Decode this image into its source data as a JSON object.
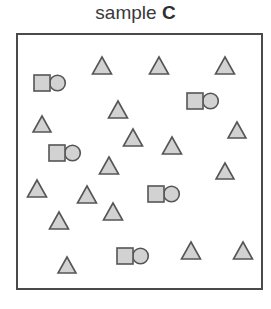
{
  "title": {
    "label": "sample",
    "id": "C"
  },
  "colors": {
    "fill": "#d2d2d2",
    "stroke": "#555555",
    "border": "#4a4a4a",
    "text": "#3a3a3a"
  },
  "shapes": {
    "triangles": [
      {
        "cx": 102,
        "top": 57,
        "bottom": 74
      },
      {
        "cx": 159,
        "top": 57,
        "bottom": 74
      },
      {
        "cx": 225,
        "top": 57,
        "bottom": 74
      },
      {
        "cx": 118,
        "top": 101,
        "bottom": 118
      },
      {
        "cx": 42,
        "top": 116,
        "bottom": 132
      },
      {
        "cx": 133,
        "top": 129,
        "bottom": 146
      },
      {
        "cx": 172,
        "top": 137,
        "bottom": 154
      },
      {
        "cx": 237,
        "top": 122,
        "bottom": 138
      },
      {
        "cx": 109,
        "top": 157,
        "bottom": 174
      },
      {
        "cx": 225,
        "top": 163,
        "bottom": 179
      },
      {
        "cx": 37,
        "top": 180,
        "bottom": 197
      },
      {
        "cx": 87,
        "top": 186,
        "bottom": 203
      },
      {
        "cx": 113,
        "top": 203,
        "bottom": 220
      },
      {
        "cx": 59,
        "top": 212,
        "bottom": 229
      },
      {
        "cx": 67,
        "top": 257,
        "bottom": 273
      },
      {
        "cx": 191,
        "top": 242,
        "bottom": 259
      },
      {
        "cx": 243,
        "top": 242,
        "bottom": 259
      }
    ],
    "square_circle_pairs": [
      {
        "x": 34,
        "y": 75
      },
      {
        "x": 187,
        "y": 93
      },
      {
        "x": 49,
        "y": 145
      },
      {
        "x": 148,
        "y": 186
      },
      {
        "x": 117,
        "y": 248
      }
    ]
  }
}
